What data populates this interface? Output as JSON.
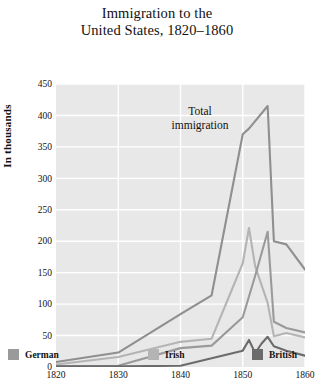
{
  "title": {
    "line1": "Immigration to the",
    "line2": "United States, 1820–1860"
  },
  "annotation": {
    "line1": "Total",
    "line2": "immigration"
  },
  "legend": [
    {
      "label": "German",
      "color": "#9a9a9a"
    },
    {
      "label": "Irish",
      "color": "#b4b4b4"
    },
    {
      "label": "British",
      "color": "#6b6b6b"
    }
  ],
  "chart_data": {
    "type": "line",
    "xlabel": "",
    "ylabel": "In thousands",
    "xlim": [
      1820,
      1860
    ],
    "ylim": [
      0,
      450
    ],
    "xticks": [
      1820,
      1830,
      1840,
      1850,
      1860
    ],
    "yticks": [
      0,
      50,
      100,
      150,
      200,
      250,
      300,
      350,
      400,
      450
    ],
    "grid": true,
    "legend_position": "below",
    "plot_background": "#e8e8e8",
    "gridline_color": "#ffffff",
    "series": [
      {
        "name": "Total immigration",
        "color": "#8f8f8f",
        "annotated_as": "Total immigration",
        "x": [
          1820,
          1830,
          1840,
          1845,
          1850,
          1851,
          1854,
          1855,
          1857,
          1860
        ],
        "values": [
          8,
          23,
          84,
          114,
          370,
          379,
          415,
          200,
          195,
          155
        ]
      },
      {
        "name": "German",
        "color": "#9a9a9a",
        "x": [
          1820,
          1830,
          1840,
          1845,
          1850,
          1852,
          1854,
          1855,
          1857,
          1860
        ],
        "values": [
          1,
          2,
          30,
          34,
          79,
          145,
          215,
          72,
          62,
          55
        ]
      },
      {
        "name": "Irish",
        "color": "#b4b4b4",
        "x": [
          1820,
          1830,
          1840,
          1845,
          1850,
          1851,
          1852,
          1854,
          1855,
          1857,
          1860
        ],
        "values": [
          4,
          16,
          40,
          45,
          165,
          221,
          160,
          102,
          49,
          54,
          47
        ]
      },
      {
        "name": "British",
        "color": "#6b6b6b",
        "x": [
          1820,
          1830,
          1840,
          1845,
          1850,
          1851,
          1852,
          1853,
          1854,
          1855,
          1857,
          1860
        ],
        "values": [
          1,
          1,
          2,
          14,
          26,
          43,
          22,
          37,
          48,
          33,
          26,
          18
        ]
      }
    ]
  }
}
